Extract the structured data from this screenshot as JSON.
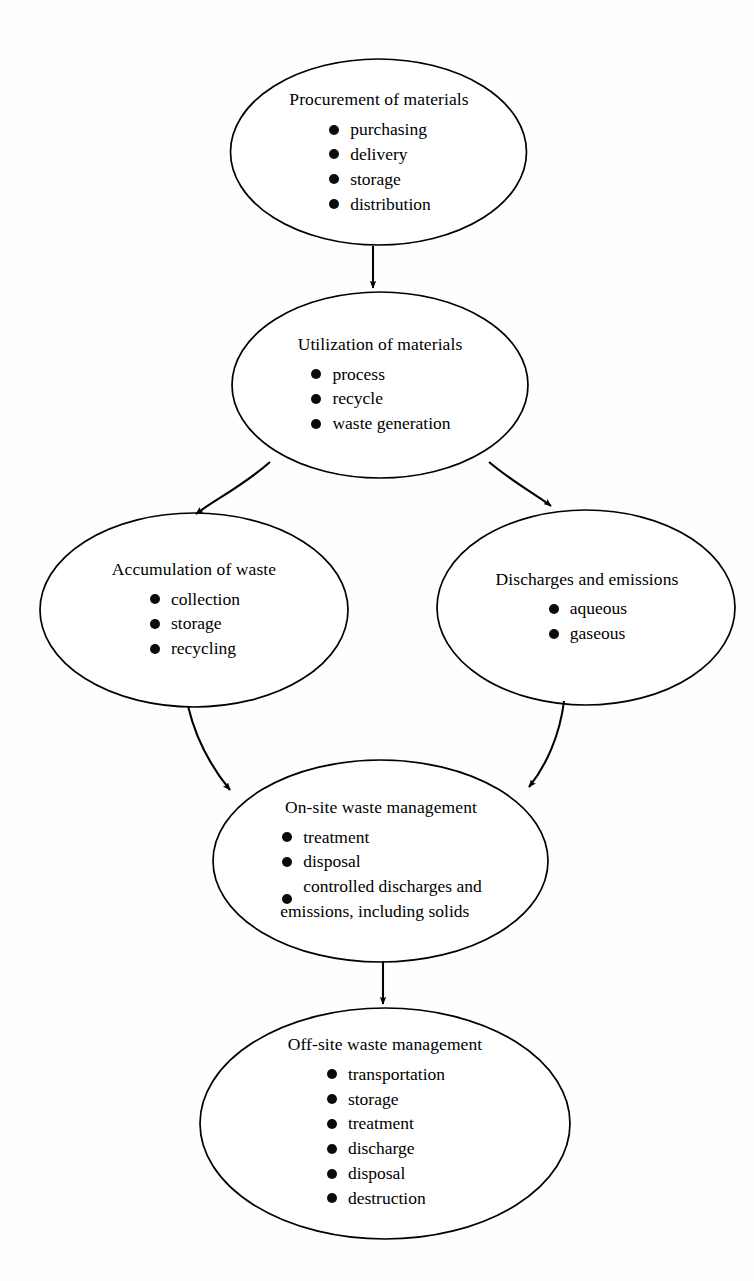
{
  "diagram": {
    "type": "flowchart",
    "orientation": "top-to-bottom",
    "background_color": "#fefefe",
    "stroke_color": "#000000",
    "text_color": "#000000",
    "nodes": [
      {
        "id": "procurement",
        "shape": "ellipse",
        "title": "Procurement of materials",
        "bullets": [
          "purchasing",
          "delivery",
          "storage",
          "distribution"
        ]
      },
      {
        "id": "utilization",
        "shape": "ellipse",
        "title": "Utilization of materials",
        "bullets": [
          "process",
          "recycle",
          "waste generation"
        ]
      },
      {
        "id": "accumulation",
        "shape": "ellipse",
        "title": "Accumulation of waste",
        "bullets": [
          "collection",
          "storage",
          "recycling"
        ]
      },
      {
        "id": "discharges",
        "shape": "ellipse",
        "title": "Discharges and emissions",
        "bullets": [
          "aqueous",
          "gaseous"
        ]
      },
      {
        "id": "onsite",
        "shape": "ellipse",
        "title": "On-site waste management",
        "bullets": [
          "treatment",
          "disposal",
          "controlled discharges and"
        ],
        "bullet_continuation": "emissions, including solids"
      },
      {
        "id": "offsite",
        "shape": "ellipse",
        "title": "Off-site waste management",
        "bullets": [
          "transportation",
          "storage",
          "treatment",
          "discharge",
          "disposal",
          "destruction"
        ]
      }
    ],
    "edges": [
      {
        "from": "procurement",
        "to": "utilization",
        "style": "straight",
        "arrow": true
      },
      {
        "from": "utilization",
        "to": "accumulation",
        "style": "curved",
        "arrow": true
      },
      {
        "from": "utilization",
        "to": "discharges",
        "style": "curved",
        "arrow": true
      },
      {
        "from": "accumulation",
        "to": "onsite",
        "style": "curved",
        "arrow": true
      },
      {
        "from": "discharges",
        "to": "onsite",
        "style": "curved",
        "arrow": true
      },
      {
        "from": "onsite",
        "to": "offsite",
        "style": "straight",
        "arrow": true
      }
    ]
  }
}
